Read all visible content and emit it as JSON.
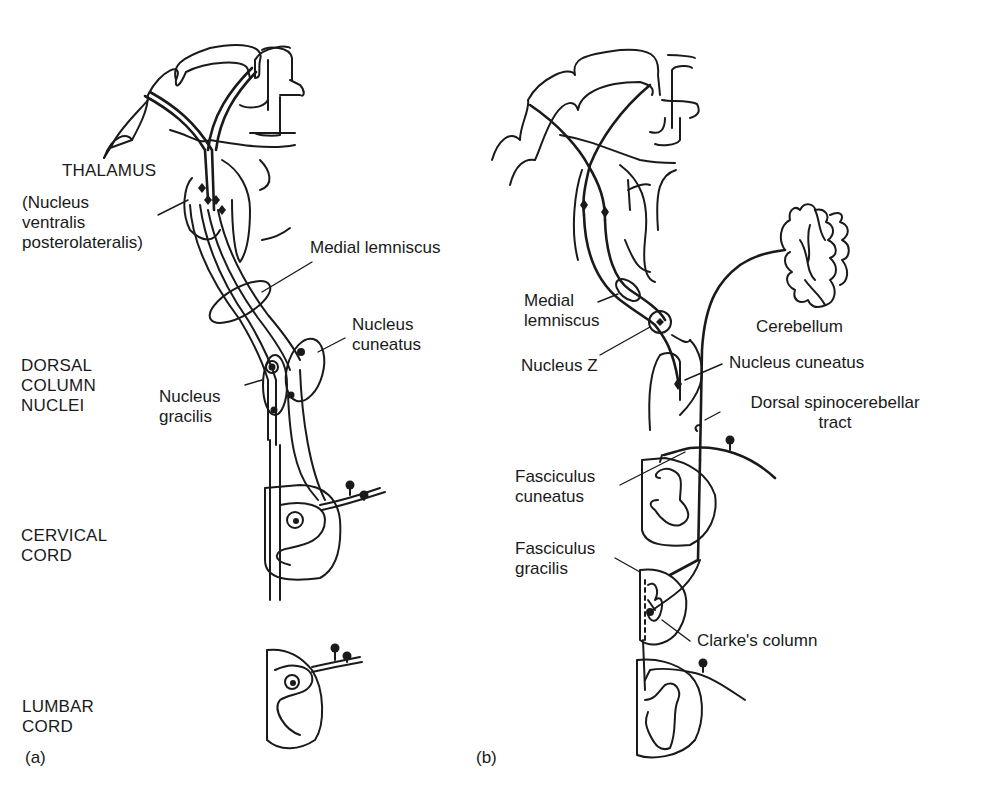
{
  "figure": {
    "panels": [
      {
        "id": "a",
        "tag": "(a)",
        "region_labels": {
          "thalamus": "THALAMUS",
          "vpl": "(Nucleus\nventralis\nposterolateralis)",
          "dorsal_column_nuclei": "DORSAL\nCOLUMN\nNUCLEI",
          "cervical_cord": "CERVICAL\nCORD",
          "lumbar_cord": "LUMBAR\nCORD"
        },
        "structure_labels": {
          "medial_lemniscus": "Medial lemniscus",
          "nucleus_cuneatus": "Nucleus\ncuneatus",
          "nucleus_gracilis": "Nucleus\ngracilis"
        }
      },
      {
        "id": "b",
        "tag": "(b)",
        "structure_labels": {
          "medial_lemniscus": "Medial\nlemniscus",
          "nucleus_z": "Nucleus Z",
          "cerebellum": "Cerebellum",
          "nucleus_cuneatus": "Nucleus cuneatus",
          "dorsal_spinocerebellar_tract": "Dorsal spinocerebellar\ntract",
          "fasciculus_cuneatus": "Fasciculus\ncuneatus",
          "fasciculus_gracilis": "Fasciculus\ngracilis",
          "clarkes_column": "Clarke's column"
        }
      }
    ],
    "colors": {
      "ink": "#1a1a1a",
      "background": "#ffffff"
    }
  }
}
